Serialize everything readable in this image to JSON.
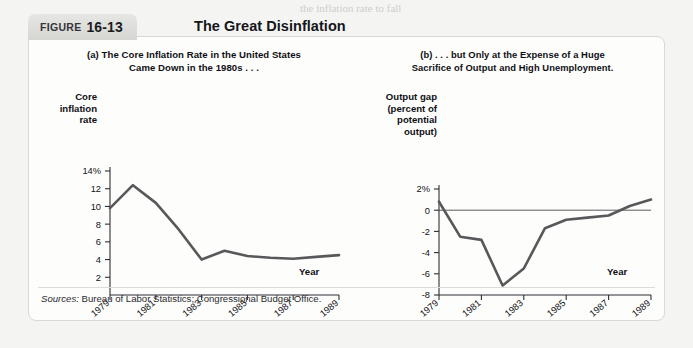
{
  "figure": {
    "label": "FIGURE",
    "number": "16-13",
    "title": "The Great Disinflation"
  },
  "sources": {
    "prefix": "Sources:",
    "text": " Bureau of Labor Statistics; Congressional Budget Office."
  },
  "chart_data": [
    {
      "id": "a",
      "type": "line",
      "title": "(a) The Core Inflation Rate in the United States\nCame Down in the 1980s . . .",
      "title_line1": "(a) The Core Inflation Rate in the United States",
      "title_line2": "Came Down in the 1980s . . .",
      "ylabel": "Core\ninflation\nrate",
      "ylabel_lines": [
        "Core",
        "inflation",
        "rate"
      ],
      "xlabel": "Year",
      "ylim": [
        0,
        14
      ],
      "yticks": [
        2,
        4,
        6,
        8,
        10,
        12,
        14
      ],
      "yticklabels": [
        "2",
        "4",
        "6",
        "8",
        "10",
        "12",
        "14%"
      ],
      "xlim": [
        1979,
        1989
      ],
      "xticks": [
        1979,
        1981,
        1983,
        1985,
        1987,
        1989
      ],
      "xticklabels": [
        "1979",
        "1981",
        "1983",
        "1985",
        "1987",
        "1989"
      ],
      "grid": false,
      "line_color": "#58585a",
      "x": [
        1979,
        1980,
        1981,
        1982,
        1983,
        1984,
        1985,
        1986,
        1987,
        1988,
        1989
      ],
      "values": [
        9.8,
        12.4,
        10.4,
        7.4,
        4.0,
        5.0,
        4.4,
        4.2,
        4.1,
        4.3,
        4.5
      ]
    },
    {
      "id": "b",
      "type": "line",
      "title": "(b) . . . but Only at the Expense of a Huge\nSacrifice of Output and High Unemployment.",
      "title_line1": "(b) . . . but Only at the Expense of a Huge",
      "title_line2": "Sacrifice of Output and High Unemployment.",
      "ylabel": "Output gap\n(percent of\npotential\noutput)",
      "ylabel_lines": [
        "Output gap",
        "(percent of",
        "potential",
        "output)"
      ],
      "xlabel": "Year",
      "ylim": [
        -8,
        2
      ],
      "yticks": [
        -8,
        -6,
        -4,
        -2,
        0,
        2
      ],
      "yticklabels": [
        "-8",
        "-6",
        "-4",
        "-2",
        "0",
        "2%"
      ],
      "xlim": [
        1979,
        1989
      ],
      "xticks": [
        1979,
        1981,
        1983,
        1985,
        1987,
        1989
      ],
      "xticklabels": [
        "1979",
        "1981",
        "1983",
        "1985",
        "1987",
        "1989"
      ],
      "grid": false,
      "zero_line": 0,
      "line_color": "#58585a",
      "x": [
        1979,
        1980,
        1981,
        1982,
        1983,
        1984,
        1985,
        1986,
        1987,
        1988,
        1989
      ],
      "values": [
        0.8,
        -2.5,
        -2.8,
        -7.1,
        -5.5,
        -1.7,
        -0.9,
        -0.7,
        -0.5,
        0.4,
        1.0
      ]
    }
  ]
}
